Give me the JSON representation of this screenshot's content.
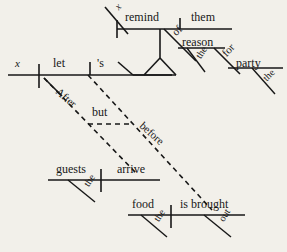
{
  "image": {
    "kind": "reed-kellogg-sentence-diagram",
    "width": 287,
    "height": 252,
    "background_color": "#f2f0ea",
    "ink_color": "#171717"
  },
  "sentence": {
    "text": "x let's x remind them of the reason for the party After the guests arrive but before the food is brought out"
  },
  "labels": {
    "main_subject_x": "x",
    "main_verb_let": "let",
    "main_object_s": "'s",
    "embedded_subject_x": "x",
    "embedded_verb_remind": "remind",
    "embedded_object_them": "them",
    "prep_of": "of",
    "prep_obj_reason": "reason",
    "det_the_reason": "the",
    "prep_for": "for",
    "prep_obj_party": "party",
    "det_the_party": "the",
    "conj_after": "After",
    "conj_but": "but",
    "conj_before": "before",
    "clause1_subject_guests": "guests",
    "clause1_det_the": "the",
    "clause1_verb_arrive": "arrive",
    "clause2_subject_food": "food",
    "clause2_det_the": "the",
    "clause2_verb_is_brought": "is brought",
    "clause2_adv_out": "out"
  },
  "label_positions": {
    "main_subject_x": {
      "x": 15,
      "y": 58,
      "size": 11,
      "italic": true,
      "rotate": 0
    },
    "main_verb_let": {
      "x": 53,
      "y": 57,
      "size": 12,
      "italic": false,
      "rotate": 0
    },
    "main_object_s": {
      "x": 97,
      "y": 57,
      "size": 12,
      "italic": false,
      "rotate": 0
    },
    "embedded_subject_x": {
      "x": 113,
      "y": 5,
      "size": 10,
      "italic": true,
      "rotate": -46
    },
    "embedded_verb_remind": {
      "x": 125,
      "y": 11,
      "size": 12,
      "italic": false,
      "rotate": 0
    },
    "embedded_object_them": {
      "x": 191,
      "y": 11,
      "size": 12,
      "italic": false,
      "rotate": 0
    },
    "prep_of": {
      "x": 170,
      "y": 30,
      "size": 11,
      "italic": false,
      "rotate": -45
    },
    "prep_obj_reason": {
      "x": 182,
      "y": 36,
      "size": 12,
      "italic": false,
      "rotate": 0
    },
    "det_the_reason": {
      "x": 194,
      "y": 55,
      "size": 10,
      "italic": false,
      "rotate": -58
    },
    "prep_for": {
      "x": 220,
      "y": 51,
      "size": 11,
      "italic": false,
      "rotate": -47
    },
    "prep_obj_party": {
      "x": 236,
      "y": 57,
      "size": 12,
      "italic": false,
      "rotate": 0
    },
    "det_the_party": {
      "x": 261,
      "y": 76,
      "size": 10,
      "italic": false,
      "rotate": -45
    },
    "conj_after": {
      "x": 61,
      "y": 86,
      "size": 11,
      "italic": false,
      "rotate": 41
    },
    "conj_but": {
      "x": 92,
      "y": 106,
      "size": 12,
      "italic": false,
      "rotate": 0
    },
    "conj_before": {
      "x": 145,
      "y": 120,
      "size": 11,
      "italic": false,
      "rotate": 42
    },
    "clause1_subject_guests": {
      "x": 56,
      "y": 163,
      "size": 12,
      "italic": false,
      "rotate": 0
    },
    "clause1_det_the": {
      "x": 82,
      "y": 183,
      "size": 10,
      "italic": false,
      "rotate": -58
    },
    "clause1_verb_arrive": {
      "x": 117,
      "y": 163,
      "size": 12,
      "italic": false,
      "rotate": 0
    },
    "clause2_subject_food": {
      "x": 132,
      "y": 198,
      "size": 12,
      "italic": false,
      "rotate": 0
    },
    "clause2_det_the": {
      "x": 152,
      "y": 218,
      "size": 10,
      "italic": false,
      "rotate": -58
    },
    "clause2_verb_is_brought": {
      "x": 180,
      "y": 198,
      "size": 12,
      "italic": false,
      "rotate": 0
    },
    "clause2_adv_out": {
      "x": 217,
      "y": 218,
      "size": 10,
      "italic": false,
      "rotate": -58
    }
  },
  "lines": {
    "solid": [
      {
        "name": "main-baseline",
        "x1": 8,
        "y1": 75,
        "x2": 172,
        "y2": 75,
        "w": 1.6
      },
      {
        "name": "main-subject-verb-divider",
        "x1": 39,
        "y1": 64,
        "x2": 39,
        "y2": 88,
        "w": 1.6
      },
      {
        "name": "main-verb-object-divider",
        "x1": 90,
        "y1": 62,
        "x2": 90,
        "y2": 75,
        "w": 1.6
      },
      {
        "name": "main-object-slant",
        "x1": 118,
        "y1": 62,
        "x2": 133,
        "y2": 75,
        "w": 1.6
      },
      {
        "name": "embedded-baseline",
        "x1": 117,
        "y1": 29,
        "x2": 232,
        "y2": 29,
        "w": 1.6
      },
      {
        "name": "embedded-subject-slant",
        "x1": 105,
        "y1": 7,
        "x2": 128,
        "y2": 34,
        "w": 1.6
      },
      {
        "name": "embedded-subj-verb-divider",
        "x1": 117,
        "y1": 20,
        "x2": 117,
        "y2": 38,
        "w": 1.6
      },
      {
        "name": "embedded-verb-obj-divider",
        "x1": 180,
        "y1": 18,
        "x2": 180,
        "y2": 29,
        "w": 1.6
      },
      {
        "name": "pedestal-stem",
        "x1": 160,
        "y1": 29,
        "x2": 160,
        "y2": 58,
        "w": 1.6
      },
      {
        "name": "pedestal-left-leg",
        "x1": 160,
        "y1": 58,
        "x2": 144,
        "y2": 75,
        "w": 1.6
      },
      {
        "name": "pedestal-right-leg",
        "x1": 160,
        "y1": 58,
        "x2": 176,
        "y2": 75,
        "w": 1.6
      },
      {
        "name": "pedestal-base",
        "x1": 133,
        "y1": 75,
        "x2": 176,
        "y2": 75,
        "w": 1.6
      },
      {
        "name": "prep-of-slant",
        "x1": 164,
        "y1": 29,
        "x2": 196,
        "y2": 61,
        "w": 1.6
      },
      {
        "name": "prep-of-object-line",
        "x1": 178,
        "y1": 48,
        "x2": 225,
        "y2": 48,
        "w": 1.6
      },
      {
        "name": "det-the-reason-slant",
        "x1": 187,
        "y1": 48,
        "x2": 205,
        "y2": 72,
        "w": 1.4
      },
      {
        "name": "prep-for-slant",
        "x1": 214,
        "y1": 48,
        "x2": 240,
        "y2": 74,
        "w": 1.6
      },
      {
        "name": "prep-for-object-line",
        "x1": 228,
        "y1": 68,
        "x2": 283,
        "y2": 68,
        "w": 1.6
      },
      {
        "name": "det-the-party-slant",
        "x1": 252,
        "y1": 68,
        "x2": 275,
        "y2": 94,
        "w": 1.4
      },
      {
        "name": "clause1-baseline",
        "x1": 48,
        "y1": 180,
        "x2": 160,
        "y2": 180,
        "w": 1.6
      },
      {
        "name": "clause1-subj-verb-divider",
        "x1": 101,
        "y1": 169,
        "x2": 101,
        "y2": 192,
        "w": 1.6
      },
      {
        "name": "clause1-det-the-slant",
        "x1": 68,
        "y1": 180,
        "x2": 95,
        "y2": 202,
        "w": 1.4
      },
      {
        "name": "clause2-baseline",
        "x1": 128,
        "y1": 215,
        "x2": 245,
        "y2": 215,
        "w": 1.6
      },
      {
        "name": "clause2-subj-verb-divider",
        "x1": 171,
        "y1": 205,
        "x2": 171,
        "y2": 228,
        "w": 1.6
      },
      {
        "name": "clause2-det-the-slant",
        "x1": 141,
        "y1": 215,
        "x2": 167,
        "y2": 237,
        "w": 1.4
      },
      {
        "name": "clause2-adv-out-slant",
        "x1": 204,
        "y1": 215,
        "x2": 231,
        "y2": 237,
        "w": 1.4
      }
    ],
    "dashed": [
      {
        "name": "conj-after-connector",
        "x1": 44,
        "y1": 78,
        "x2": 136,
        "y2": 173,
        "w": 1.6,
        "dash": "5,4"
      },
      {
        "name": "conj-but-connector",
        "x1": 88,
        "y1": 124,
        "x2": 130,
        "y2": 124,
        "w": 1.6,
        "dash": "5,4"
      },
      {
        "name": "conj-before-connector",
        "x1": 88,
        "y1": 75,
        "x2": 212,
        "y2": 210,
        "w": 1.6,
        "dash": "5,4"
      }
    ],
    "solid_short": [
      {
        "name": "conj-after-solid-start",
        "x1": 44,
        "y1": 78,
        "x2": 62,
        "y2": 96,
        "w": 1.6
      }
    ]
  }
}
